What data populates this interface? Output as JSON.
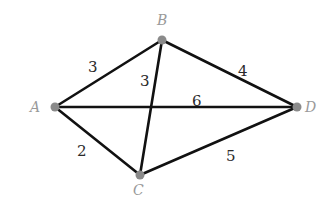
{
  "graph": {
    "type": "weighted-undirected-graph",
    "colors": {
      "edge": "#111111",
      "node": "#8a8a8a",
      "node_label": "#9a9a9a",
      "weight": "#2a2a2a"
    },
    "nodes": [
      {
        "id": "A",
        "label": "A",
        "x": 55,
        "y": 107
      },
      {
        "id": "B",
        "label": "B",
        "x": 162,
        "y": 40
      },
      {
        "id": "C",
        "label": "C",
        "x": 140,
        "y": 175
      },
      {
        "id": "D",
        "label": "D",
        "x": 297,
        "y": 107
      }
    ],
    "edges": [
      {
        "from": "A",
        "to": "B",
        "weight": "3"
      },
      {
        "from": "B",
        "to": "C",
        "weight": "3"
      },
      {
        "from": "B",
        "to": "D",
        "weight": "4"
      },
      {
        "from": "A",
        "to": "D",
        "weight": "6"
      },
      {
        "from": "A",
        "to": "C",
        "weight": "2"
      },
      {
        "from": "C",
        "to": "D",
        "weight": "5"
      }
    ]
  }
}
